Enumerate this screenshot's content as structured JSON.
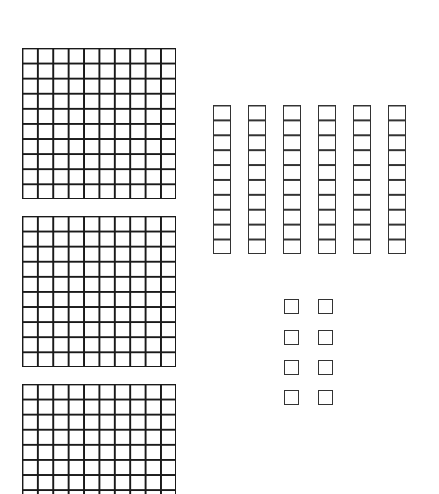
{
  "diagram": {
    "type": "base-ten-blocks",
    "colors": {
      "stroke": "#1a1a1a",
      "background": "#ffffff"
    },
    "hundreds": {
      "count": 3,
      "grid": "10x10",
      "note": "third flat partially cropped at bottom edge"
    },
    "tens": {
      "count": 6,
      "cells_per_rod": 10
    },
    "ones": {
      "count": 8,
      "layout": "2 columns x 4 rows"
    }
  }
}
